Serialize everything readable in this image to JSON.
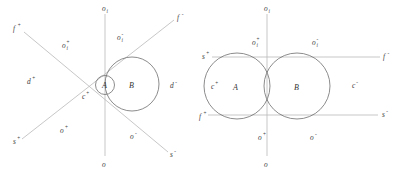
{
  "figure": {
    "caption": "",
    "stroke_colors": {
      "axis": "#b9b9b9",
      "circle": "#6f6f6f",
      "label": "#3d3d3d"
    }
  },
  "left_diagram": {
    "name": "tangent-circles-oblique-axes",
    "circles": [
      {
        "id": "A",
        "label": "A",
        "cx": 105,
        "cy": 85,
        "r": 9.5
      },
      {
        "id": "B",
        "label": "B",
        "cx": 132,
        "cy": 84,
        "r": 27
      }
    ],
    "axis_labels": {
      "vertical_top": "o",
      "vertical_top_sub": "i",
      "vertical_bottom": "o",
      "diag_upper_left": "f",
      "diag_upper_left_sup": "+",
      "diag_upper_right": "f",
      "diag_upper_right_sup": "-",
      "diag_lower_left": "s",
      "diag_lower_left_sup": "+",
      "diag_lower_right": "s",
      "diag_lower_right_sup": "-"
    },
    "region_labels": [
      {
        "name": "oi-plus",
        "base": "o",
        "sub": "i",
        "sup": "+",
        "x": 62,
        "y": 48
      },
      {
        "name": "oi-minus",
        "base": "o",
        "sub": "i",
        "sup": "-",
        "x": 117,
        "y": 40
      },
      {
        "name": "d-plus",
        "base": "d",
        "sub": "",
        "sup": "+",
        "x": 27,
        "y": 84
      },
      {
        "name": "d-minus",
        "base": "d",
        "sub": "",
        "sup": "-",
        "x": 170,
        "y": 88
      },
      {
        "name": "c-plus",
        "base": "c",
        "sub": "",
        "sup": "+",
        "x": 82,
        "y": 99
      },
      {
        "name": "o-plus",
        "base": "o",
        "sub": "",
        "sup": "+",
        "x": 60,
        "y": 133
      },
      {
        "name": "o-minus",
        "base": "o",
        "sub": "",
        "sup": "-",
        "x": 130,
        "y": 139
      }
    ]
  },
  "right_diagram": {
    "name": "overlapping-circles-orthogonal-axes",
    "circles": [
      {
        "id": "A",
        "label": "A",
        "cx": 237,
        "cy": 86,
        "r": 33
      },
      {
        "id": "B",
        "label": "B",
        "cx": 297,
        "cy": 86,
        "r": 33
      }
    ],
    "axis_labels": {
      "vertical_top": "o",
      "vertical_top_sub": "i",
      "vertical_bottom": "o",
      "upper_line_left": "s",
      "upper_line_left_sup": "+",
      "upper_line_right": "f",
      "upper_line_right_sup": "-",
      "lower_line_left": "f",
      "lower_line_left_sup": "+",
      "lower_line_right": "s",
      "lower_line_right_sup": "-"
    },
    "region_labels": [
      {
        "name": "oi-plus",
        "base": "o",
        "sub": "i",
        "sup": "+",
        "x": 252,
        "y": 45
      },
      {
        "name": "oi-minus",
        "base": "o",
        "sub": "i",
        "sup": "-",
        "x": 312,
        "y": 45
      },
      {
        "name": "c-plus",
        "base": "c",
        "sub": "",
        "sup": "+",
        "x": 211,
        "y": 89
      },
      {
        "name": "c-minus",
        "base": "c",
        "sub": "",
        "sup": "-",
        "x": 352,
        "y": 88
      },
      {
        "name": "o-plus",
        "base": "o",
        "sub": "",
        "sup": "+",
        "x": 258,
        "y": 140
      },
      {
        "name": "o-minus",
        "base": "o",
        "sub": "",
        "sup": "-",
        "x": 310,
        "y": 140
      }
    ]
  }
}
